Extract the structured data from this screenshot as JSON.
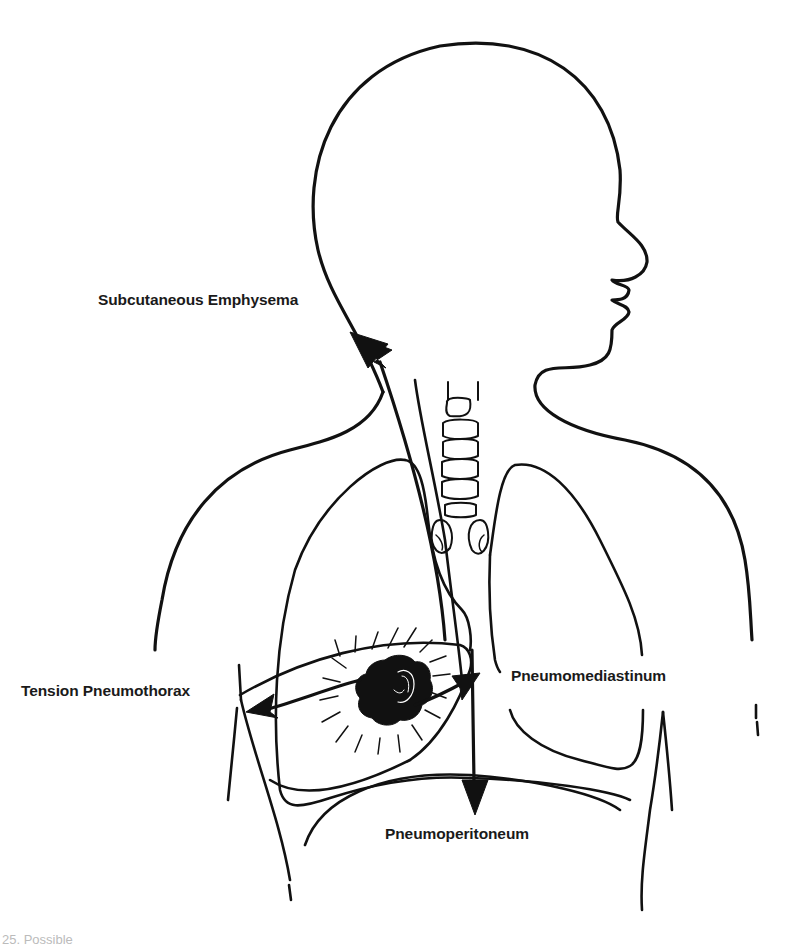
{
  "figure": {
    "line_color": "#111111",
    "background": "#ffffff"
  },
  "labels": {
    "subcutaneous_emphysema": "Subcutaneous Emphysema",
    "tension_pneumothorax": "Tension Pneumothorax",
    "pneumomediastinum": "Pneumomediastinum",
    "pneumoperitoneum": "Pneumoperitoneum"
  },
  "arrows": [
    {
      "from": "lesion",
      "to": "neck",
      "label": "Subcutaneous Emphysema"
    },
    {
      "from": "lesion",
      "to": "pleural-space",
      "label": "Tension Pneumothorax"
    },
    {
      "from": "lesion",
      "to": "mediastinum",
      "label": "Pneumomediastinum"
    },
    {
      "from": "mediastinum",
      "to": "abdomen",
      "label": "Pneumoperitoneum"
    }
  ],
  "caption": {
    "text": "25. Possible"
  }
}
